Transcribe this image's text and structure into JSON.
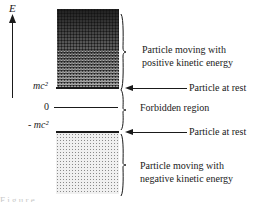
{
  "axis": {
    "label": "E",
    "direction": "up"
  },
  "levels": {
    "positive": "mc²",
    "zero": "0",
    "negative": "- mc²"
  },
  "regions": {
    "upper": "Particle moving with positive kinetic energy",
    "upper_line1": "Particle moving with",
    "upper_line2": "positive kinetic energy",
    "middle": "Forbidden region",
    "lower_line1": "Particle moving with",
    "lower_line2": "negative kinetic energy"
  },
  "annotations": {
    "rest_top": "Particle at rest",
    "rest_bottom": "Particle at rest"
  },
  "caption_fragment": "F i g u r e"
}
